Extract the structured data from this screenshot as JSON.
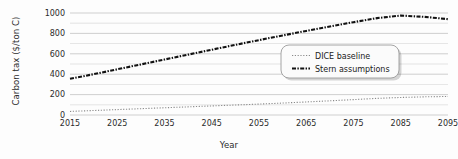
{
  "chart_data": {
    "type": "line",
    "title": "",
    "xlabel": "Year",
    "ylabel": "Carbon tax ($/ton C)",
    "xlim": [
      2015,
      2095
    ],
    "ylim": [
      0,
      1000
    ],
    "xticks": [
      "2015",
      "2025",
      "2035",
      "2045",
      "2055",
      "2065",
      "2075",
      "2085",
      "2095"
    ],
    "yticks": [
      "0",
      "200",
      "400",
      "600",
      "800",
      "1000"
    ],
    "minor_gridlines_step": 100,
    "grid": true,
    "grid_axis": "y",
    "legend_position": "center-right",
    "x": [
      2015,
      2020,
      2025,
      2030,
      2035,
      2040,
      2045,
      2050,
      2055,
      2060,
      2065,
      2070,
      2075,
      2080,
      2085,
      2090,
      2095
    ],
    "series": [
      {
        "name": "DICE baseline",
        "style": "dotted",
        "color": "#8a8a8a",
        "values": [
          35,
          44,
          53,
          62,
          71,
          80,
          89,
          98,
          107,
          117,
          128,
          139,
          151,
          163,
          172,
          178,
          182
        ]
      },
      {
        "name": "Stern assumptions",
        "style": "dash-dot",
        "color": "#111111",
        "values": [
          355,
          400,
          448,
          496,
          544,
          592,
          640,
          688,
          734,
          780,
          824,
          868,
          910,
          950,
          975,
          962,
          940
        ]
      }
    ]
  },
  "legend": {
    "items": [
      {
        "label": "DICE baseline",
        "swatch": "dotted-line-swatch"
      },
      {
        "label": "Stern assumptions",
        "swatch": "dashdot-line-swatch"
      }
    ]
  },
  "colors": {
    "grid": "#c9c9c9",
    "axis_text": "#2b2b2b",
    "dice": "#8a8a8a",
    "stern": "#111111",
    "legend_border": "#9a9a9a",
    "legend_fill": "#fbfbfb",
    "background": "#fdfdfd"
  }
}
